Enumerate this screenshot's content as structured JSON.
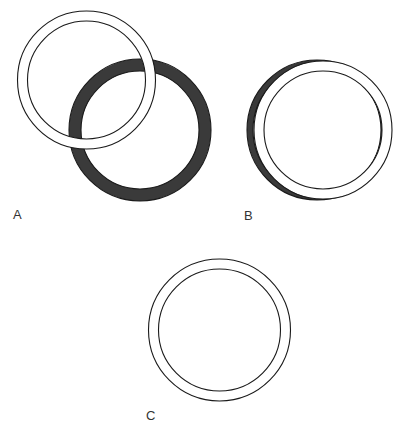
{
  "figure": {
    "width": 405,
    "height": 429,
    "background": "#ffffff",
    "stroke_color": "#1a1a1a",
    "dark_fill": "#3a3a3a",
    "light_fill": "#ffffff"
  },
  "panels": [
    {
      "label": "A",
      "description": "Light ring overlapping a dark ring, offset diagonally",
      "label_pos": [
        13,
        219
      ],
      "rings": [
        {
          "name": "dark-ring",
          "fill": "#3a3a3a",
          "cx": 140,
          "cy": 130,
          "r_outer": 71,
          "r_inner": 59
        },
        {
          "name": "light-ring",
          "fill": "#ffffff",
          "cx": 86.5,
          "cy": 80,
          "r_outer": 69,
          "r_inner": 59
        }
      ]
    },
    {
      "label": "B",
      "description": "Light ring nearly aligned over a dark ring, slight horizontal offset",
      "label_pos": [
        244,
        220
      ],
      "rings": [
        {
          "name": "dark-ring",
          "fill": "#3a3a3a",
          "cx": 317,
          "cy": 130,
          "r_outer": 70,
          "r_inner": 64
        },
        {
          "name": "light-ring",
          "fill": "#ffffff",
          "cx": 323,
          "cy": 130,
          "r_outer": 69,
          "r_inner": 59
        }
      ]
    },
    {
      "label": "C",
      "description": "Single light ring (rings fully aligned)",
      "label_pos": [
        146,
        420
      ],
      "rings": [
        {
          "name": "light-ring",
          "fill": "#ffffff",
          "cx": 219.5,
          "cy": 330,
          "r_outer": 71,
          "r_inner": 61
        }
      ]
    }
  ]
}
